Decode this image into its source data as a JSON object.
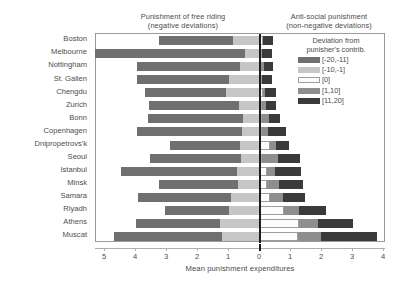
{
  "headers": {
    "left_line1": "Punishment of free riding",
    "left_line2": "(negative deviations)",
    "right_line1": "Anti-social punishment",
    "right_line2": "(non-negative deviations)"
  },
  "legend": {
    "title_line1": "Deviation from",
    "title_line2": "punisher's contrib.",
    "items": [
      {
        "label": "[-20,-11]",
        "color": "#6f6f6f",
        "key": "c1"
      },
      {
        "label": "[-10,-1]",
        "color": "#c6c6c6",
        "key": "c2"
      },
      {
        "label": "[0]",
        "color": "#fcfcfc",
        "key": "c3"
      },
      {
        "label": "[1,10]",
        "color": "#8e8e8e",
        "key": "c4"
      },
      {
        "label": "[11,20]",
        "color": "#3a3a3a",
        "key": "c5"
      }
    ]
  },
  "chart_data": {
    "type": "bar",
    "orientation": "horizontal",
    "stacked": true,
    "diverging": true,
    "title": "",
    "xlabel": "Mean punishment expenditures",
    "ylabel": "",
    "xlim": [
      -5.55,
      4.15
    ],
    "xticks": [
      -5,
      -4,
      -3,
      -2,
      -1,
      0,
      1,
      2,
      3,
      4
    ],
    "xticklabels": [
      "5",
      "4",
      "3",
      "2",
      "1",
      "0",
      "1",
      "2",
      "3",
      "4"
    ],
    "grid": false,
    "legend_position": "top-right outside",
    "categories": [
      "Boston",
      "Melbourne",
      "Nottingham",
      "St. Gallen",
      "Chengdu",
      "Zurich",
      "Bonn",
      "Copenhagen",
      "Dnipropetrovs'k",
      "Seoul",
      "Istanbul",
      "Minsk",
      "Samara",
      "Riyadh",
      "Athens",
      "Muscat"
    ],
    "series": [
      {
        "name": "[-20,-11]",
        "color": "#6f6f6f",
        "values": [
          2.39,
          4.84,
          3.33,
          2.96,
          2.6,
          2.9,
          3.06,
          3.4,
          2.25,
          2.92,
          3.75,
          2.55,
          3.0,
          2.07,
          2.71,
          3.48
        ]
      },
      {
        "name": "[-10,-1]",
        "color": "#c6c6c6",
        "values": [
          0.87,
          0.48,
          0.65,
          1.0,
          1.1,
          0.68,
          0.55,
          0.58,
          0.65,
          0.62,
          0.74,
          0.71,
          0.94,
          1.0,
          1.29,
          1.22
        ]
      },
      {
        "name": "[0] (negative side)",
        "color": "#fcfcfc",
        "values": [
          0.0,
          0.0,
          0.0,
          0.0,
          0.0,
          0.0,
          0.0,
          0.0,
          0.0,
          0.0,
          0.0,
          0.0,
          0.0,
          0.0,
          0.0,
          0.0
        ]
      },
      {
        "name": "[0]",
        "color": "#fcfcfc",
        "values": [
          0.1,
          0.06,
          0.0,
          0.06,
          0.1,
          0.06,
          0.06,
          0.06,
          0.32,
          0.06,
          0.23,
          0.23,
          0.32,
          0.77,
          1.26,
          1.23
        ]
      },
      {
        "name": "[1,10]",
        "color": "#8e8e8e",
        "values": [
          0.0,
          0.0,
          0.13,
          0.0,
          0.06,
          0.13,
          0.23,
          0.19,
          0.19,
          0.52,
          0.26,
          0.39,
          0.42,
          0.48,
          0.61,
          0.74
        ]
      },
      {
        "name": "[11,20]",
        "color": "#3a3a3a",
        "values": [
          0.32,
          0.32,
          0.29,
          0.32,
          0.36,
          0.32,
          0.36,
          0.58,
          0.42,
          0.71,
          0.84,
          0.77,
          0.71,
          0.87,
          1.13,
          1.81
        ]
      }
    ]
  }
}
